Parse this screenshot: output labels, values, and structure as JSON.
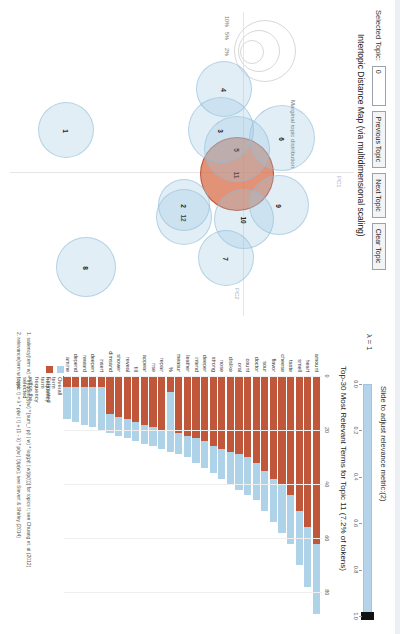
{
  "app": {
    "title": "LDAvis topic model visualization"
  },
  "controls": {
    "selected_topic_label": "Selected Topic:",
    "selected_topic_value": "0",
    "previous_topic_label": "Previous Topic",
    "next_topic_label": "Next Topic",
    "clear_topic_label": "Clear Topic"
  },
  "map": {
    "title": "Intertopic Distance Map (via multidimensional scaling)",
    "x_axis_tag": "PC2",
    "y_axis_tag": "PC1",
    "legend_title": "Marginal topic distribution",
    "legend_percents": [
      "2%",
      "5%",
      "10%"
    ]
  },
  "slider": {
    "label": "Slide to adjust relevance metric:(2)",
    "lambda_label": "λ = 1",
    "value": 1.0,
    "ticks": [
      "0.0",
      "0.2",
      "0.4",
      "0.6",
      "0.8",
      "1.0"
    ]
  },
  "barchart": {
    "title": "Top-30 Most Relevant Terms for Topic 11 (7.2% of tokens)",
    "x_ticks": [
      0,
      20,
      40,
      60,
      80
    ],
    "x_max": 88,
    "legend": {
      "overall_label": "Overall term frequency",
      "estimated_label": "Estimated term frequency within the selected topic"
    },
    "footnotes": [
      "1. saliency(term w) = frequency(w) * [sum_t p(t | w) * log(p(t | w)/p(t))] for topics t; see Chuang et. al (2012)",
      "2. relevance(term w | topic t) = λ * p(w | t) + (1 - λ) * p(w | t)/p(w); see Sievert & Shirley (2014)"
    ],
    "colors": {
      "overall": "#aed3e8",
      "estimated": "#c0563a",
      "selected_bubble": "#d76842",
      "bubble": "#9bc8e1"
    }
  },
  "chart_data": {
    "type": "bar",
    "title": "Top-30 Most Relevant Terms for Topic 11 (7.2% of tokens)",
    "xlabel": "",
    "ylabel": "",
    "xlim": [
      0,
      88
    ],
    "grid": false,
    "legend_position": "bottom-left",
    "categories": [
      "amount",
      "heart",
      "smell",
      "taste",
      "cheese",
      "flavor",
      "sour",
      "doctor",
      "count",
      "oral",
      "dislike",
      "nose",
      "strong",
      "deeper",
      "intend",
      "leather",
      "measur",
      "%",
      "repair",
      "rise",
      "appear",
      "fill",
      "reveal",
      "shower",
      "dimsand",
      "insert",
      "deepen",
      "reward",
      "depend",
      "amine"
    ],
    "series": [
      {
        "name": "Overall term frequency",
        "values": [
          88,
          78,
          70,
          62,
          58,
          54,
          50,
          46,
          44,
          42,
          40,
          38,
          36,
          34,
          32,
          30,
          29,
          28,
          27,
          26,
          25,
          24,
          23,
          22,
          21,
          20,
          19,
          18,
          17,
          16
        ]
      },
      {
        "name": "Estimated term frequency within the selected topic",
        "values": [
          62,
          56,
          50,
          44,
          40,
          38,
          35,
          32,
          30,
          29,
          28,
          27,
          26,
          24,
          23,
          22,
          21,
          6,
          20,
          19,
          18,
          17,
          16,
          15,
          14,
          4,
          4,
          4,
          4,
          4
        ]
      }
    ]
  },
  "topics": [
    {
      "id": "11",
      "x": 162,
      "y": 117,
      "r": 37,
      "selected": true
    },
    {
      "id": "6",
      "x": 126,
      "y": 72,
      "r": 33,
      "selected": false
    },
    {
      "id": "5",
      "x": 137,
      "y": 117,
      "r": 33,
      "selected": false
    },
    {
      "id": "3",
      "x": 118,
      "y": 133,
      "r": 33,
      "selected": false
    },
    {
      "id": "9",
      "x": 193,
      "y": 75,
      "r": 30,
      "selected": false
    },
    {
      "id": "10",
      "x": 207,
      "y": 110,
      "r": 30,
      "selected": false
    },
    {
      "id": "7",
      "x": 246,
      "y": 128,
      "r": 28,
      "selected": false
    },
    {
      "id": "12",
      "x": 205,
      "y": 170,
      "r": 28,
      "selected": false
    },
    {
      "id": "2",
      "x": 193,
      "y": 170,
      "r": 26,
      "selected": false
    },
    {
      "id": "4",
      "x": 77,
      "y": 130,
      "r": 28,
      "selected": false
    },
    {
      "id": "8",
      "x": 255,
      "y": 268,
      "r": 30,
      "selected": false
    },
    {
      "id": "1",
      "x": 118,
      "y": 288,
      "r": 28,
      "selected": false
    }
  ]
}
